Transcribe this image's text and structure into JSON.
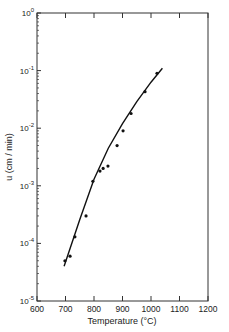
{
  "chart_data": {
    "type": "scatter",
    "title": "",
    "xlabel": "Temperature (°C)",
    "ylabel": "u (cm / min)",
    "xlim": [
      600,
      1200
    ],
    "ylim": [
      1e-05,
      1
    ],
    "yscale": "log",
    "grid": false,
    "legend": null,
    "x_ticks": [
      600,
      700,
      800,
      900,
      1000,
      1100,
      1200
    ],
    "x_tick_labels": [
      "600",
      "700",
      "800",
      "900",
      "1000",
      "1100",
      "1200"
    ],
    "y_ticks": [
      1e-05,
      0.0001,
      0.001,
      0.01,
      0.1,
      1
    ],
    "y_tick_labels": [
      "10-5",
      "10-4",
      "10-3",
      "10-2",
      "10-1",
      "100"
    ],
    "series": [
      {
        "name": "measured",
        "kind": "points",
        "x": [
          698,
          716,
          733,
          772,
          796,
          821,
          832,
          849,
          881,
          902,
          930,
          979,
          1021
        ],
        "y": [
          5e-05,
          6e-05,
          0.00013,
          0.0003,
          0.0012,
          0.0018,
          0.002,
          0.0022,
          0.005,
          0.009,
          0.018,
          0.043,
          0.09
        ]
      },
      {
        "name": "fit",
        "kind": "line",
        "x": [
          695,
          750,
          800,
          850,
          900,
          950,
          1000,
          1040
        ],
        "y": [
          4e-05,
          0.00026,
          0.0013,
          0.0045,
          0.012,
          0.029,
          0.063,
          0.11
        ]
      }
    ]
  }
}
